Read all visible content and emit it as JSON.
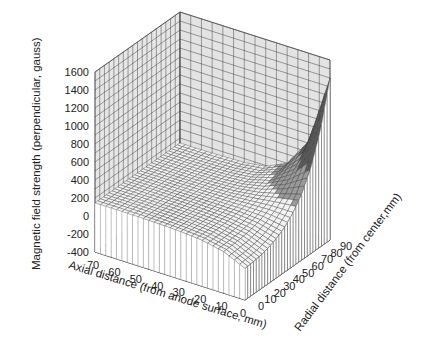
{
  "chart_data": {
    "type": "surface3d",
    "title": "",
    "zlabel": "Magnetic field strength (perpendicular, gauss)",
    "xlabel": "Axial distance (from anode surface, mm)",
    "ylabel": "Radial distance (from center,mm)",
    "z_ticks": [
      "1600",
      "1400",
      "1200",
      "1000",
      "800",
      "600",
      "400",
      "200",
      "0",
      "-200",
      "-400"
    ],
    "x_ticks": [
      "70",
      "60",
      "50",
      "40",
      "30",
      "20",
      "10",
      "0"
    ],
    "y_ticks": [
      "0",
      "10",
      "20",
      "30",
      "40",
      "50",
      "60",
      "70",
      "80",
      "90"
    ],
    "zlim": [
      -400,
      1600
    ],
    "xlim": [
      0,
      70
    ],
    "ylim": [
      0,
      90
    ],
    "grid": true,
    "legend": "none",
    "series": [
      {
        "name": "field",
        "x_axial_mm": [
          0,
          10,
          20,
          30,
          40,
          50,
          60,
          70
        ],
        "y_radial_mm": [
          0,
          10,
          20,
          30,
          40,
          50,
          60,
          70,
          80,
          90
        ],
        "z_gauss_by_axial_rows": [
          [
            -50,
            -40,
            -20,
            20,
            80,
            180,
            330,
            560,
            900,
            1400
          ],
          [
            60,
            65,
            75,
            95,
            130,
            185,
            260,
            360,
            480,
            620
          ],
          [
            110,
            112,
            118,
            128,
            145,
            170,
            200,
            235,
            270,
            300
          ],
          [
            130,
            131,
            134,
            139,
            146,
            155,
            165,
            175,
            185,
            190
          ],
          [
            140,
            140,
            141,
            143,
            146,
            149,
            152,
            155,
            157,
            158
          ],
          [
            143,
            143,
            143,
            144,
            145,
            146,
            147,
            148,
            149,
            150
          ],
          [
            145,
            145,
            145,
            145,
            145,
            145,
            145,
            145,
            145,
            145
          ],
          [
            145,
            145,
            145,
            145,
            145,
            145,
            145,
            145,
            145,
            145
          ]
        ]
      }
    ]
  }
}
